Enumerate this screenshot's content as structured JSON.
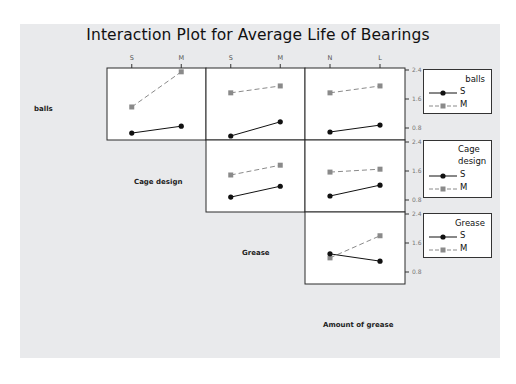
{
  "chart_data": {
    "type": "line",
    "title": "Interaction Plot for Average Life of Bearings",
    "factors": [
      "balls",
      "Cage design",
      "Grease",
      "Amount of grease"
    ],
    "y_ticks": [
      2.4,
      1.6,
      0.8
    ],
    "ylim": [
      0.5,
      2.45
    ],
    "x_tick_labels": {
      "Cage design": [
        "S",
        "M"
      ],
      "Grease": [
        "S",
        "M"
      ],
      "Amount of grease": [
        "N",
        "L"
      ]
    },
    "panels": [
      {
        "trace_factor": "balls",
        "x_factor": "Cage design",
        "x": [
          "S",
          "M"
        ],
        "series": [
          {
            "name": "S",
            "values": [
              0.66,
              0.85
            ]
          },
          {
            "name": "M",
            "values": [
              1.38,
              2.35
            ]
          }
        ]
      },
      {
        "trace_factor": "balls",
        "x_factor": "Grease",
        "x": [
          "S",
          "M"
        ],
        "series": [
          {
            "name": "S",
            "values": [
              0.58,
              0.97
            ]
          },
          {
            "name": "M",
            "values": [
              1.77,
              1.96
            ]
          }
        ]
      },
      {
        "trace_factor": "balls",
        "x_factor": "Amount of grease",
        "x": [
          "N",
          "L"
        ],
        "series": [
          {
            "name": "S",
            "values": [
              0.69,
              0.88
            ]
          },
          {
            "name": "M",
            "values": [
              1.77,
              1.96
            ]
          }
        ]
      },
      {
        "trace_factor": "Cage design",
        "x_factor": "Grease",
        "x": [
          "S",
          "M"
        ],
        "series": [
          {
            "name": "S",
            "values": [
              0.88,
              1.18
            ]
          },
          {
            "name": "M",
            "values": [
              1.49,
              1.76
            ]
          }
        ]
      },
      {
        "trace_factor": "Cage design",
        "x_factor": "Amount of grease",
        "x": [
          "N",
          "L"
        ],
        "series": [
          {
            "name": "S",
            "values": [
              0.91,
              1.21
            ]
          },
          {
            "name": "M",
            "values": [
              1.57,
              1.65
            ]
          }
        ]
      },
      {
        "trace_factor": "Grease",
        "x_factor": "Amount of grease",
        "x": [
          "N",
          "L"
        ],
        "series": [
          {
            "name": "S",
            "values": [
              1.3,
              1.1
            ]
          },
          {
            "name": "M",
            "values": [
              1.19,
              1.8
            ]
          }
        ]
      }
    ],
    "legends": [
      {
        "title": "balls",
        "entries": [
          "S",
          "M"
        ]
      },
      {
        "title": "Cage design",
        "entries": [
          "S",
          "M"
        ]
      },
      {
        "title": "Grease",
        "entries": [
          "S",
          "M"
        ]
      }
    ],
    "series_style": {
      "S": {
        "color": "#111111",
        "marker": "circle",
        "line": "solid"
      },
      "M": {
        "color": "#8a8a8a",
        "marker": "square",
        "line": "dashed"
      }
    },
    "grid": false
  },
  "labels": {
    "title": "Interaction Plot for Average Life of Bearings",
    "balls": "balls",
    "cage_design": "Cage design",
    "grease": "Grease",
    "amount": "Amount of grease",
    "legend_balls": "balls",
    "legend_cage_1": "Cage",
    "legend_cage_2": "design",
    "legend_grease": "Grease",
    "legend_s": "S",
    "legend_m": "M"
  }
}
